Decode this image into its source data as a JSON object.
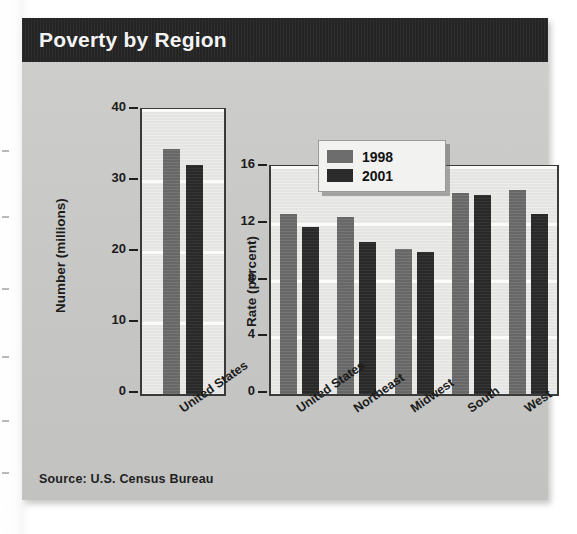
{
  "header": {
    "title": "Poverty by Region"
  },
  "source": {
    "text": "Source:  U.S. Census Bureau"
  },
  "legend": {
    "position": "top-center-right-chart",
    "entries": [
      {
        "label": "1998",
        "color": "#6d6d6d"
      },
      {
        "label": "2001",
        "color": "#2b2b2b"
      }
    ]
  },
  "colors": {
    "header_bar": "#262626",
    "card_background": "#c7c7c5",
    "plot_background": "#e9e9e7",
    "series_1998": "#6d6d6d",
    "series_2001": "#2b2b2b",
    "axis": "#1f1f1f"
  },
  "chart_data": [
    {
      "type": "bar",
      "id": "number-chart",
      "title": "Poverty by Region",
      "xlabel": "",
      "ylabel": "Number (millions)",
      "ylim": [
        0,
        40
      ],
      "yticks": [
        0,
        10,
        20,
        30,
        40
      ],
      "ytick_labels": [
        "0",
        "10",
        "20",
        "30",
        "40"
      ],
      "grid": true,
      "categories": [
        "United States"
      ],
      "series": [
        {
          "name": "1998",
          "color": "#6d6d6d",
          "values": [
            34.5
          ]
        },
        {
          "name": "2001",
          "color": "#2b2b2b",
          "values": [
            32.3
          ]
        }
      ]
    },
    {
      "type": "bar",
      "id": "rate-chart",
      "title": "Poverty by Region",
      "xlabel": "",
      "ylabel": "Rate (percent)",
      "ylim": [
        0,
        16
      ],
      "yticks": [
        0,
        4,
        8,
        12,
        16
      ],
      "ytick_labels": [
        "0",
        "4",
        "8",
        "12",
        "16"
      ],
      "grid": true,
      "categories": [
        "United States",
        "Northeast",
        "Midwest",
        "South",
        "West"
      ],
      "series": [
        {
          "name": "1998",
          "color": "#6d6d6d",
          "values": [
            12.7,
            12.5,
            10.2,
            14.2,
            14.4
          ]
        },
        {
          "name": "2001",
          "color": "#2b2b2b",
          "values": [
            11.8,
            10.7,
            10.0,
            14.0,
            12.7
          ]
        }
      ]
    }
  ]
}
